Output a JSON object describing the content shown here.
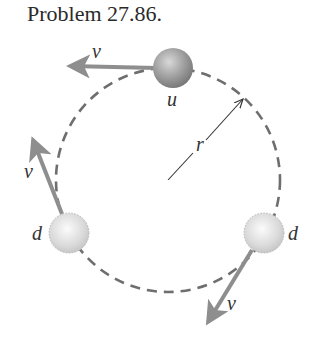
{
  "title": "Problem 27.86.",
  "diagram": {
    "labels": {
      "top_velocity": "v",
      "top_particle": "u",
      "radius": "r",
      "left_velocity": "v",
      "left_particle": "d",
      "right_particle": "d",
      "right_velocity": "v"
    },
    "colors": {
      "arrow": "#8e8e8e",
      "dashed_circle": "#6e6e6e",
      "particle_u": "#9a9a9a",
      "particle_d": "#d6d6d6"
    }
  }
}
